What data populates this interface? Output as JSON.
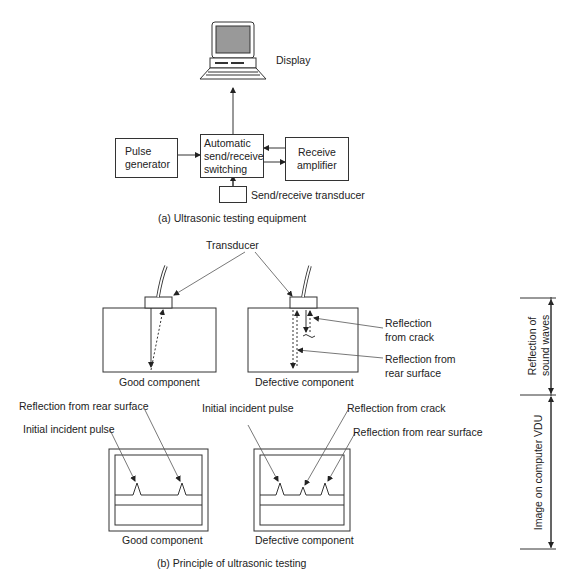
{
  "equipment": {
    "display_label": "Display",
    "pulse_generator": [
      "Pulse",
      "generator"
    ],
    "switching": [
      "Automatic",
      "send/receive",
      "switching"
    ],
    "receive_amplifier": [
      "Receive",
      "amplifier"
    ],
    "transducer_label": "Send/receive transducer",
    "caption": "(a) Ultrasonic testing equipment"
  },
  "principle": {
    "transducer_label": "Transducer",
    "good_component_label": "Good component",
    "defective_component_label": "Defective component",
    "reflection_from_crack": [
      "Reflection",
      "from crack"
    ],
    "reflection_from_rear": [
      "Reflection from",
      "rear surface"
    ],
    "screens": {
      "good": {
        "reflection_rear": "Reflection from rear surface",
        "initial_pulse": "Initial incident pulse",
        "label": "Good component"
      },
      "defective": {
        "initial_pulse": "Initial incident pulse",
        "reflection_crack": "Reflection from crack",
        "reflection_rear": "Reflection from rear surface",
        "label": "Defective component"
      }
    },
    "side_labels": {
      "top": [
        "Reflection of",
        "sound waves"
      ],
      "bottom": "Image on computer VDU"
    },
    "caption": "(b) Principle of ultrasonic testing"
  }
}
